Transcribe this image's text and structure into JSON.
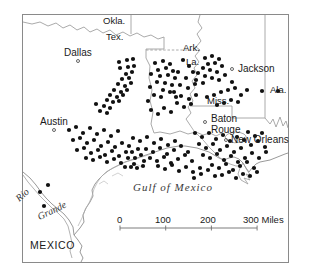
{
  "map": {
    "title": "Distribution map of the western Gulf Coast region",
    "frame": {
      "x": 22,
      "y": 14,
      "width": 266,
      "height": 248
    },
    "colors": {
      "frame": "#8a8a8a",
      "border_line": "#9a9a9a",
      "coastline": "#9a9a9a",
      "dot": "#111111",
      "city_marker": "#555555",
      "text": "#1a1a1a",
      "water_text": "#3a3a3a",
      "background": "#ffffff"
    },
    "state_labels": [
      {
        "name": "Okla.",
        "text": "Okla.",
        "x": 103,
        "y": 16
      },
      {
        "name": "Tex.",
        "text": "Tex.",
        "x": 106,
        "y": 32
      },
      {
        "name": "Ark.",
        "text": "Ark.",
        "x": 183,
        "y": 43
      },
      {
        "name": "La.",
        "text": "La.",
        "x": 186,
        "y": 57
      },
      {
        "name": "Miss.",
        "text": "Miss.",
        "x": 207,
        "y": 96
      },
      {
        "name": "Ala.",
        "text": "Ala.",
        "x": 270,
        "y": 85
      }
    ],
    "city_labels": [
      {
        "name": "Dallas",
        "text": "Dallas",
        "x": 64,
        "y": 48,
        "marker_x": 78,
        "marker_y": 61
      },
      {
        "name": "Austin",
        "text": "Austin",
        "x": 40,
        "y": 117,
        "marker_x": 54,
        "marker_y": 130
      },
      {
        "name": "Jackson",
        "text": "Jackson",
        "x": 238,
        "y": 64,
        "marker_x": 232,
        "marker_y": 69
      },
      {
        "name": "Baton Rouge",
        "text": "Baton",
        "x": 211,
        "y": 114,
        "marker_x": 205,
        "marker_y": 122
      },
      {
        "name": "Rouge",
        "text": "Rouge",
        "x": 211,
        "y": 125,
        "marker_x": null,
        "marker_y": null
      },
      {
        "name": "New Orleans",
        "text": "New Orleans",
        "x": 231,
        "y": 135,
        "marker_x": 226,
        "marker_y": 140
      }
    ],
    "country_labels": [
      {
        "name": "MEXICO",
        "text": "MEXICO",
        "x": 30,
        "y": 240
      }
    ],
    "water_labels": [
      {
        "name": "gulf-of-mexico",
        "text": "Gulf   of   Mexico",
        "x": 133,
        "y": 182
      },
      {
        "name": "rio-grande-rio",
        "text": "Rio",
        "x": 14,
        "y": 196,
        "rotate": -42
      },
      {
        "name": "rio-grande-grande",
        "text": "Grande",
        "x": 36,
        "y": 213,
        "rotate": -26
      }
    ],
    "scale_bar": {
      "name": "scale-bar",
      "unit": "Miles",
      "ticks": [
        "0",
        "100",
        "200",
        "300"
      ],
      "label_text": "300 Miles",
      "x": 120,
      "y": 228,
      "length": 137,
      "tick_spacing": 45.7,
      "numbers": [
        {
          "text": "0",
          "x": 117
        },
        {
          "text": "100",
          "x": 155
        },
        {
          "text": "200",
          "x": 200
        },
        {
          "text": "300 Miles",
          "x": 243
        }
      ]
    },
    "dots": [
      [
        119,
        62
      ],
      [
        127,
        60
      ],
      [
        133,
        59
      ],
      [
        120,
        68
      ],
      [
        128,
        67
      ],
      [
        134,
        66
      ],
      [
        126,
        74
      ],
      [
        132,
        72
      ],
      [
        122,
        79
      ],
      [
        129,
        78
      ],
      [
        118,
        84
      ],
      [
        125,
        86
      ],
      [
        131,
        83
      ],
      [
        114,
        90
      ],
      [
        121,
        92
      ],
      [
        127,
        90
      ],
      [
        110,
        95
      ],
      [
        117,
        97
      ],
      [
        123,
        95
      ],
      [
        107,
        100
      ],
      [
        113,
        102
      ],
      [
        119,
        101
      ],
      [
        104,
        106
      ],
      [
        110,
        108
      ],
      [
        100,
        111
      ],
      [
        96,
        104
      ],
      [
        107,
        113
      ],
      [
        155,
        63
      ],
      [
        163,
        61
      ],
      [
        170,
        64
      ],
      [
        158,
        70
      ],
      [
        166,
        68
      ],
      [
        173,
        71
      ],
      [
        151,
        74
      ],
      [
        160,
        76
      ],
      [
        168,
        75
      ],
      [
        175,
        78
      ],
      [
        157,
        82
      ],
      [
        165,
        83
      ],
      [
        172,
        85
      ],
      [
        150,
        87
      ],
      [
        163,
        90
      ],
      [
        170,
        92
      ],
      [
        154,
        95
      ],
      [
        161,
        97
      ],
      [
        148,
        101
      ],
      [
        176,
        97
      ],
      [
        205,
        58
      ],
      [
        212,
        56
      ],
      [
        219,
        59
      ],
      [
        208,
        64
      ],
      [
        215,
        63
      ],
      [
        222,
        66
      ],
      [
        203,
        68
      ],
      [
        210,
        70
      ],
      [
        217,
        72
      ],
      [
        198,
        73
      ],
      [
        205,
        76
      ],
      [
        212,
        78
      ],
      [
        219,
        80
      ],
      [
        196,
        80
      ],
      [
        203,
        83
      ],
      [
        225,
        75
      ],
      [
        232,
        82
      ],
      [
        228,
        90
      ],
      [
        235,
        88
      ],
      [
        221,
        92
      ],
      [
        214,
        95
      ],
      [
        207,
        97
      ],
      [
        241,
        95
      ],
      [
        247,
        90
      ],
      [
        238,
        102
      ],
      [
        231,
        100
      ],
      [
        224,
        103
      ],
      [
        217,
        105
      ],
      [
        262,
        91
      ],
      [
        278,
        91
      ],
      [
        183,
        60
      ],
      [
        189,
        66
      ],
      [
        178,
        72
      ],
      [
        186,
        78
      ],
      [
        193,
        72
      ],
      [
        180,
        85
      ],
      [
        188,
        88
      ],
      [
        195,
        84
      ],
      [
        174,
        92
      ],
      [
        181,
        96
      ],
      [
        189,
        99
      ],
      [
        196,
        95
      ],
      [
        177,
        103
      ],
      [
        184,
        107
      ],
      [
        191,
        104
      ],
      [
        164,
        108
      ],
      [
        171,
        112
      ],
      [
        158,
        114
      ],
      [
        151,
        110
      ],
      [
        69,
        130
      ],
      [
        76,
        127
      ],
      [
        83,
        133
      ],
      [
        90,
        128
      ],
      [
        97,
        134
      ],
      [
        104,
        130
      ],
      [
        111,
        136
      ],
      [
        118,
        131
      ],
      [
        73,
        140
      ],
      [
        80,
        138
      ],
      [
        87,
        143
      ],
      [
        94,
        140
      ],
      [
        101,
        146
      ],
      [
        108,
        142
      ],
      [
        115,
        147
      ],
      [
        122,
        143
      ],
      [
        77,
        150
      ],
      [
        84,
        148
      ],
      [
        91,
        153
      ],
      [
        98,
        150
      ],
      [
        105,
        155
      ],
      [
        112,
        151
      ],
      [
        119,
        156
      ],
      [
        126,
        152
      ],
      [
        86,
        158
      ],
      [
        93,
        160
      ],
      [
        100,
        157
      ],
      [
        107,
        162
      ],
      [
        114,
        159
      ],
      [
        121,
        163
      ],
      [
        128,
        158
      ],
      [
        129,
        146
      ],
      [
        132,
        152
      ],
      [
        135,
        158
      ],
      [
        138,
        149
      ],
      [
        141,
        155
      ],
      [
        144,
        161
      ],
      [
        134,
        164
      ],
      [
        131,
        167
      ],
      [
        137,
        168
      ],
      [
        143,
        166
      ],
      [
        125,
        167
      ],
      [
        133,
        138
      ],
      [
        140,
        141
      ],
      [
        147,
        137
      ],
      [
        154,
        143
      ],
      [
        161,
        139
      ],
      [
        168,
        145
      ],
      [
        175,
        141
      ],
      [
        146,
        149
      ],
      [
        153,
        152
      ],
      [
        160,
        148
      ],
      [
        167,
        154
      ],
      [
        174,
        150
      ],
      [
        181,
        146
      ],
      [
        188,
        152
      ],
      [
        150,
        158
      ],
      [
        157,
        161
      ],
      [
        164,
        157
      ],
      [
        171,
        163
      ],
      [
        178,
        159
      ],
      [
        185,
        155
      ],
      [
        192,
        161
      ],
      [
        158,
        166
      ],
      [
        165,
        169
      ],
      [
        172,
        165
      ],
      [
        179,
        171
      ],
      [
        186,
        167
      ],
      [
        193,
        172
      ],
      [
        200,
        168
      ],
      [
        195,
        133
      ],
      [
        202,
        137
      ],
      [
        209,
        133
      ],
      [
        216,
        139
      ],
      [
        223,
        135
      ],
      [
        230,
        141
      ],
      [
        237,
        137
      ],
      [
        199,
        144
      ],
      [
        206,
        148
      ],
      [
        213,
        144
      ],
      [
        220,
        150
      ],
      [
        227,
        146
      ],
      [
        234,
        152
      ],
      [
        241,
        148
      ],
      [
        203,
        155
      ],
      [
        210,
        158
      ],
      [
        217,
        154
      ],
      [
        224,
        160
      ],
      [
        231,
        156
      ],
      [
        238,
        162
      ],
      [
        245,
        158
      ],
      [
        212,
        165
      ],
      [
        219,
        168
      ],
      [
        226,
        164
      ],
      [
        233,
        170
      ],
      [
        240,
        166
      ],
      [
        247,
        162
      ],
      [
        254,
        168
      ],
      [
        222,
        175
      ],
      [
        229,
        172
      ],
      [
        236,
        178
      ],
      [
        243,
        174
      ],
      [
        250,
        176
      ],
      [
        257,
        172
      ],
      [
        208,
        170
      ],
      [
        215,
        176
      ],
      [
        201,
        174
      ],
      [
        194,
        178
      ],
      [
        244,
        140
      ],
      [
        251,
        145
      ],
      [
        258,
        141
      ],
      [
        265,
        147
      ],
      [
        252,
        153
      ],
      [
        259,
        158
      ],
      [
        266,
        152
      ],
      [
        248,
        132
      ],
      [
        255,
        136
      ],
      [
        262,
        133
      ],
      [
        40,
        192
      ],
      [
        44,
        206
      ],
      [
        48,
        185
      ]
    ]
  }
}
